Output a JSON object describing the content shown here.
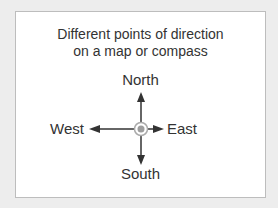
{
  "diagram": {
    "title_line1": "Different points of direction",
    "title_line2": "on a map or compass",
    "directions": {
      "north": "North",
      "south": "South",
      "east": "East",
      "west": "West"
    },
    "center_icon": "center-point-icon",
    "colors": {
      "background": "#ededed",
      "card": "#ffffff",
      "border": "#bdbdbd",
      "text": "#333333",
      "arrow": "#333333",
      "center_fill": "#9e9e9e",
      "center_ring": "#aaaaaa"
    }
  }
}
